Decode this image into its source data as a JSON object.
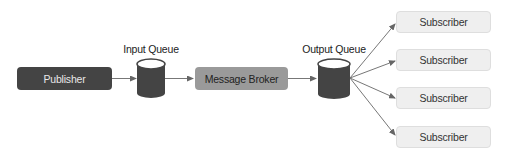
{
  "diagram": {
    "nodes": {
      "publisher": "Publisher",
      "input_queue": "Input Queue",
      "broker": "Message Broker",
      "output_queue": "Output Queue",
      "subscribers": [
        "Subscriber",
        "Subscriber",
        "Subscriber",
        "Subscriber"
      ]
    },
    "edges": [
      [
        "Publisher",
        "Input Queue"
      ],
      [
        "Input Queue",
        "Message Broker"
      ],
      [
        "Message Broker",
        "Output Queue"
      ],
      [
        "Output Queue",
        "Subscriber 1"
      ],
      [
        "Output Queue",
        "Subscriber 2"
      ],
      [
        "Output Queue",
        "Subscriber 3"
      ],
      [
        "Output Queue",
        "Subscriber 4"
      ]
    ],
    "colors": {
      "publisher_fill": "#444444",
      "broker_fill": "#9a9a9a",
      "queue_fill": "#444444",
      "subscriber_fill": "#efefef",
      "arrow": "#666666"
    }
  }
}
